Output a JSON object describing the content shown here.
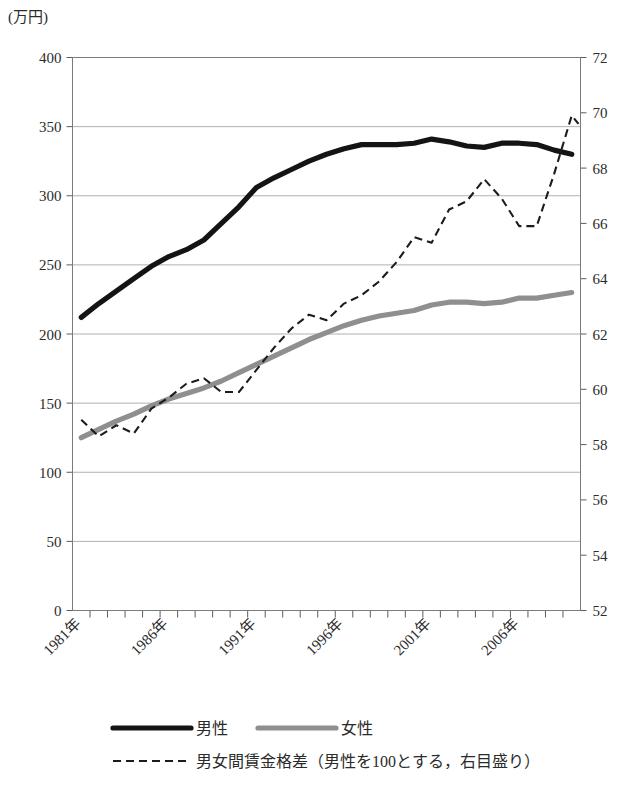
{
  "chart_data": {
    "type": "line",
    "title": "",
    "unit_label": "(万円)",
    "xlabel": "",
    "ylabel": "",
    "grid": true,
    "legend_position": "bottom",
    "x": [
      1981,
      1982,
      1983,
      1984,
      1985,
      1986,
      1987,
      1988,
      1989,
      1990,
      1991,
      1992,
      1993,
      1994,
      1995,
      1996,
      1997,
      1998,
      1999,
      2000,
      2001,
      2002,
      2003,
      2004,
      2005,
      2006,
      2007,
      2008,
      2009
    ],
    "x_tick_labels": [
      "1981年",
      "1986年",
      "1991年",
      "1996年",
      "2001年",
      "2006年"
    ],
    "x_tick_values": [
      1981,
      1986,
      1991,
      1996,
      2001,
      2006
    ],
    "left_axis": {
      "ticks": [
        0,
        50,
        100,
        150,
        200,
        250,
        300,
        350,
        400
      ],
      "ylim": [
        0,
        400
      ],
      "unit": "万円"
    },
    "right_axis": {
      "ticks": [
        52,
        54,
        56,
        58,
        60,
        62,
        64,
        66,
        68,
        70,
        72
      ],
      "ylim": [
        52,
        72
      ],
      "unit": ""
    },
    "series": [
      {
        "name": "男性",
        "axis": "left",
        "style": "solid",
        "color": "#141414",
        "values": [
          212,
          222,
          231,
          240,
          249,
          256,
          261,
          268,
          280,
          292,
          306,
          313,
          319,
          325,
          330,
          334,
          337,
          337,
          337,
          338,
          341,
          339,
          336,
          335,
          338,
          338,
          337,
          333,
          330
        ]
      },
      {
        "name": "女性",
        "axis": "left",
        "style": "solid",
        "color": "#8f8f8f",
        "values": [
          125,
          131,
          137,
          142,
          148,
          153,
          157,
          161,
          166,
          172,
          178,
          184,
          190,
          196,
          201,
          206,
          210,
          213,
          215,
          217,
          221,
          223,
          223,
          222,
          223,
          226,
          226,
          228,
          230
        ]
      },
      {
        "name": "男女間賃金格差（男性を100とする，右目盛り）",
        "axis": "right",
        "style": "dashed",
        "color": "#1c1c1c",
        "values": [
          58.9,
          58.3,
          58.7,
          58.4,
          59.3,
          59.7,
          60.2,
          60.4,
          59.9,
          59.9,
          60.7,
          61.5,
          62.2,
          62.7,
          62.5,
          63.1,
          63.4,
          63.9,
          64.6,
          65.5,
          65.3,
          66.5,
          66.8,
          67.6,
          66.9,
          65.9,
          65.9,
          67.8,
          69.9
        ],
        "final_value": 69.6
      }
    ],
    "legend": [
      {
        "label": "男性",
        "style": "solid",
        "color": "#141414",
        "row": 0
      },
      {
        "label": "女性",
        "style": "solid",
        "color": "#8f8f8f",
        "row": 0
      },
      {
        "label": "男女間賃金格差（男性を100とする，右目盛り）",
        "style": "dashed",
        "color": "#1c1c1c",
        "row": 1
      }
    ]
  }
}
